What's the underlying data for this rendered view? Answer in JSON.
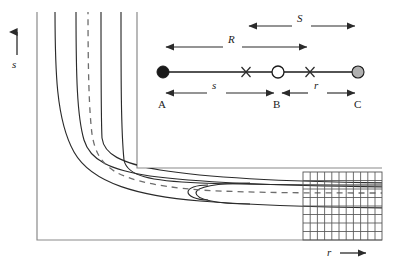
{
  "figure": {
    "type": "schematic-diagram",
    "title": "",
    "background": "#ffffff",
    "line_color": "#2b2b2b",
    "frame_color": "#8a8a8a",
    "grid_color": "#555555"
  },
  "axes": {
    "vertical": {
      "label": "s",
      "icon": "up-arrow-icon",
      "direction": "up",
      "x": 17,
      "arrow_top_y": 30,
      "arrow_bottom_y": 55,
      "label_x": 13,
      "label_y": 64
    },
    "horizontal": {
      "label": "r",
      "icon": "right-arrow-icon",
      "direction": "right",
      "y": 255,
      "arrow_left_x": 340,
      "arrow_right_x": 368,
      "label_x": 328,
      "label_y": 251
    }
  },
  "domain_outline": {
    "description": "L-shaped flow domain: vertical inlet duct joined to horizontal outlet duct",
    "vertical_duct": {
      "left_x": 37,
      "right_x": 137,
      "top_y": 12
    },
    "horizontal_duct": {
      "top_y": 168,
      "bottom_y": 240,
      "right_x": 382
    },
    "corner": {
      "x": 137,
      "y": 168
    }
  },
  "streamlines": {
    "count": 2,
    "style": "solid",
    "description": "two nested U-shaped boundary curves turning the corner"
  },
  "centerline": {
    "style": "dashed",
    "description": "dashed symmetry centerline running down the vertical duct, around the corner, and along the horizontal duct"
  },
  "mesh": {
    "label": "computational grid",
    "left_x": 303,
    "right_x": 382,
    "top_y": 172,
    "bottom_y": 240,
    "columns": 11,
    "rows": 8,
    "style": "uniform rectangular"
  },
  "point_diagram": {
    "baseline_y": 72,
    "nodes": [
      {
        "id": "A",
        "label": "A",
        "x": 163,
        "marker": "filled-circle",
        "fill": "#1a1a1a",
        "stroke": "#1a1a1a",
        "radius": 6
      },
      {
        "id": "B",
        "label": "B",
        "x": 278,
        "marker": "open-circle",
        "fill": "#ffffff",
        "stroke": "#1a1a1a",
        "radius": 6
      },
      {
        "id": "C",
        "label": "C",
        "x": 358,
        "marker": "gray-circle",
        "fill": "#b0b0b0",
        "stroke": "#1a1a1a",
        "radius": 6
      }
    ],
    "cross_markers": [
      {
        "x": 246,
        "glyph": "x-marker"
      },
      {
        "x": 310,
        "glyph": "x-marker"
      }
    ],
    "node_label_y": 106,
    "dimensions": [
      {
        "name": "S",
        "label": "S",
        "italic": true,
        "from_x": 246,
        "to_x": 358,
        "y": 26,
        "label_x": 301,
        "label_y": 18,
        "position": "above"
      },
      {
        "name": "R",
        "label": "R",
        "italic": true,
        "from_x": 163,
        "to_x": 310,
        "y": 47,
        "label_x": 232,
        "label_y": 39,
        "position": "above"
      },
      {
        "name": "s",
        "label": "s",
        "italic": true,
        "from_x": 163,
        "to_x": 276,
        "y": 93,
        "label_x": 216,
        "label_y": 85,
        "position": "below"
      },
      {
        "name": "r",
        "label": "r",
        "italic": true,
        "from_x": 280,
        "to_x": 358,
        "y": 93,
        "label_x": 317,
        "label_y": 85,
        "position": "below"
      }
    ]
  }
}
